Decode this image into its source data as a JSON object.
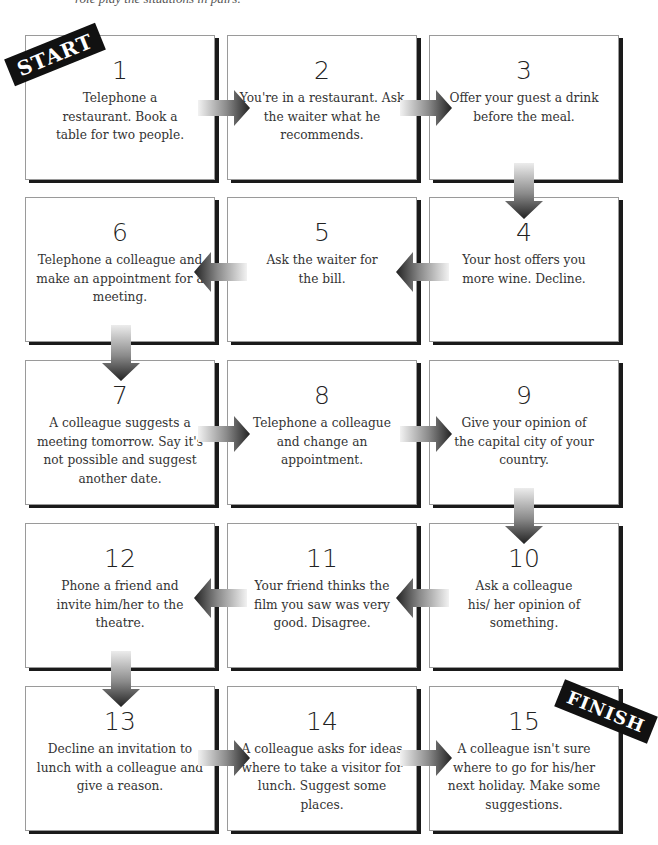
{
  "intro_text": "role play the situations in pairs.",
  "labels": {
    "start": "START",
    "finish": "FINISH"
  },
  "colors": {
    "card_border": "#9a9a9a",
    "card_shadow": "#1a1a1a",
    "tag_bg": "#111111",
    "arrow_dark": "#2a2a2a",
    "arrow_light": "#e6e6e6"
  },
  "cards": [
    {
      "number": "1",
      "text": "Telephone a restaurant. Book a table for two people."
    },
    {
      "number": "2",
      "text": "You're in a restaurant. Ask the waiter what he recommends."
    },
    {
      "number": "3",
      "text": "Offer your guest a drink before the meal."
    },
    {
      "number": "4",
      "text": "Your host offers you more wine. Decline."
    },
    {
      "number": "5",
      "text": "Ask the waiter for the bill."
    },
    {
      "number": "6",
      "text": "Telephone a colleague and make an appointment for a meeting."
    },
    {
      "number": "7",
      "text": "A colleague suggests a meeting tomorrow. Say it's not possible and suggest another date."
    },
    {
      "number": "8",
      "text": "Telephone a colleague and change an appointment."
    },
    {
      "number": "9",
      "text": "Give your opinion of the capital city of your country."
    },
    {
      "number": "10",
      "text": "Ask a colleague his/ her opinion of something."
    },
    {
      "number": "11",
      "text": "Your friend thinks the film you saw was very good. Disagree."
    },
    {
      "number": "12",
      "text": "Phone a friend and invite him/her to the theatre."
    },
    {
      "number": "13",
      "text": "Decline an invitation to lunch with a colleague and give a reason."
    },
    {
      "number": "14",
      "text": "A colleague asks for ideas where to take a visitor for lunch. Suggest some places."
    },
    {
      "number": "15",
      "text": "A colleague isn't sure where to go for his/her next holiday. Make some suggestions."
    }
  ],
  "arrows": [
    {
      "from": "1",
      "to": "2",
      "direction": "right"
    },
    {
      "from": "2",
      "to": "3",
      "direction": "right"
    },
    {
      "from": "3",
      "to": "4",
      "direction": "down"
    },
    {
      "from": "4",
      "to": "5",
      "direction": "left"
    },
    {
      "from": "5",
      "to": "6",
      "direction": "left"
    },
    {
      "from": "6",
      "to": "7",
      "direction": "down"
    },
    {
      "from": "7",
      "to": "8",
      "direction": "right"
    },
    {
      "from": "8",
      "to": "9",
      "direction": "right"
    },
    {
      "from": "9",
      "to": "10",
      "direction": "down"
    },
    {
      "from": "10",
      "to": "11",
      "direction": "left"
    },
    {
      "from": "11",
      "to": "12",
      "direction": "left"
    },
    {
      "from": "12",
      "to": "13",
      "direction": "down"
    },
    {
      "from": "13",
      "to": "14",
      "direction": "right"
    },
    {
      "from": "14",
      "to": "15",
      "direction": "right"
    }
  ]
}
